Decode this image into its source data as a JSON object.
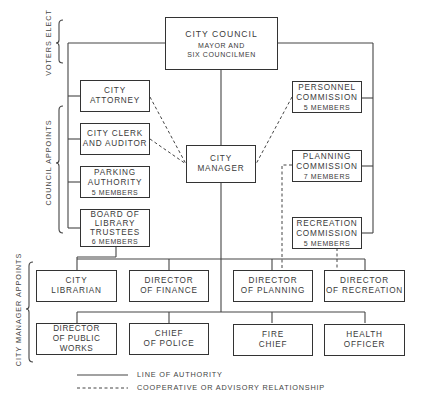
{
  "diagram": {
    "type": "organization-chart",
    "side_labels": {
      "voters_elect": "VOTERS ELECT",
      "council_appoints": "COUNCIL APPOINTS",
      "city_manager_appoints": "CITY MANAGER APPOINTS"
    },
    "council": {
      "title": "CITY COUNCIL",
      "line1": "MAYOR AND",
      "line2": "SIX COUNCILMEN"
    },
    "city_manager": {
      "line1": "CITY",
      "line2": "MANAGER"
    },
    "council_appointees_left": [
      {
        "line1": "CITY",
        "line2": "ATTORNEY"
      },
      {
        "line1": "CITY CLERK",
        "line2": "AND AUDITOR"
      },
      {
        "line1": "PARKING",
        "line2": "AUTHORITY",
        "line3": "5 MEMBERS"
      },
      {
        "line1": "BOARD OF",
        "line2": "LIBRARY",
        "line3": "TRUSTEES",
        "line4": "6 MEMBERS"
      }
    ],
    "council_appointees_right": [
      {
        "line1": "PERSONNEL",
        "line2": "COMMISSION",
        "line3": "5 MEMBERS"
      },
      {
        "line1": "PLANNING",
        "line2": "COMMISSION",
        "line3": "7 MEMBERS"
      },
      {
        "line1": "RECREATION",
        "line2": "COMMISSION",
        "line3": "5 MEMBERS"
      }
    ],
    "manager_appointees_row1": [
      {
        "line1": "CITY",
        "line2": "LIBRARIAN"
      },
      {
        "line1": "DIRECTOR",
        "line2": "OF FINANCE"
      },
      {
        "line1": "DIRECTOR",
        "line2": "OF PLANNING"
      },
      {
        "line1": "DIRECTOR",
        "line2": "OF RECREATION"
      }
    ],
    "manager_appointees_row2": [
      {
        "line1": "DIRECTOR",
        "line2": "OF PUBLIC WORKS"
      },
      {
        "line1": "CHIEF",
        "line2": "OF POLICE"
      },
      {
        "line1": "FIRE",
        "line2": "CHIEF"
      },
      {
        "line1": "HEALTH",
        "line2": "OFFICER"
      }
    ],
    "legend": {
      "solid": "LINE OF AUTHORITY",
      "dashed": "COOPERATIVE OR ADVISORY RELATIONSHIP"
    },
    "colors": {
      "line": "#333333",
      "text": "#3a3a3a",
      "background": "#ffffff"
    }
  }
}
